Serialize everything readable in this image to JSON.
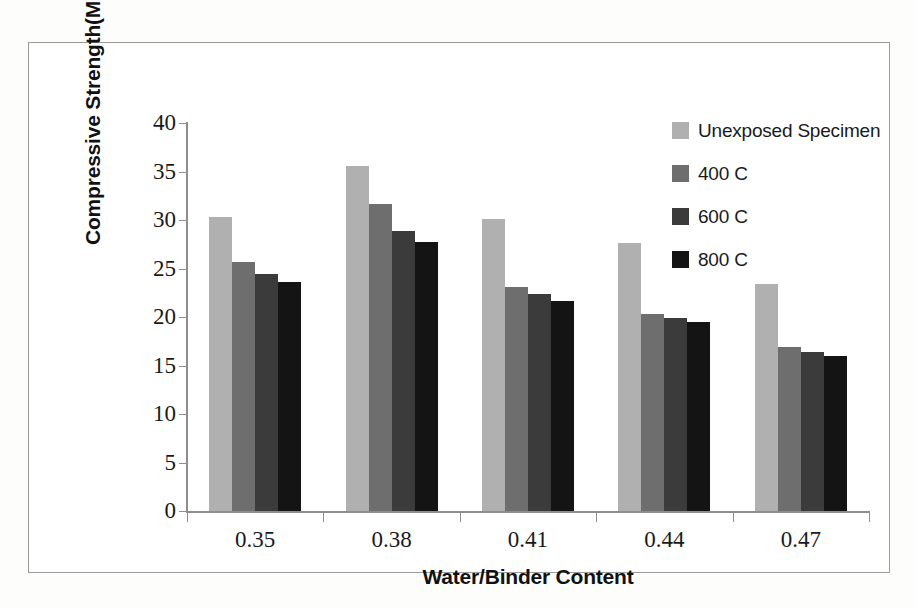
{
  "chart_data": {
    "type": "bar",
    "title": "",
    "xlabel": "Water/Binder Content",
    "ylabel": "Compressive Strength(Mpa)",
    "categories": [
      "0.35",
      "0.38",
      "0.41",
      "0.44",
      "0.47"
    ],
    "ylim": [
      0,
      40
    ],
    "yticks": [
      0,
      5,
      10,
      15,
      20,
      25,
      30,
      35,
      40
    ],
    "ytick_labels": [
      "0",
      "5",
      "10",
      "15",
      "20",
      "25",
      "30",
      "35",
      "40"
    ],
    "grid": false,
    "legend_position": "top-right",
    "series": [
      {
        "name": "Unexposed Specimen",
        "color": "#b0b0b0",
        "values": [
          30.3,
          35.6,
          30.1,
          27.6,
          23.4
        ]
      },
      {
        "name": "400 C",
        "color": "#6e6e6e",
        "values": [
          25.7,
          31.7,
          23.1,
          20.3,
          16.9
        ]
      },
      {
        "name": "600 C",
        "color": "#3b3b3b",
        "values": [
          24.4,
          28.9,
          22.4,
          19.9,
          16.4
        ]
      },
      {
        "name": "800 C",
        "color": "#141414",
        "values": [
          23.6,
          27.7,
          21.7,
          19.5,
          16.0
        ]
      }
    ]
  }
}
